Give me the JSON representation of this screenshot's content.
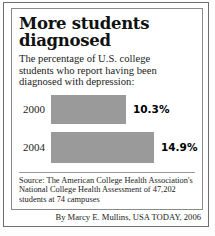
{
  "headline": {
    "line1": "More students",
    "line2": "diagnosed"
  },
  "subhead": {
    "line1": "The percentage of U.S. college",
    "line2": "students who report having been",
    "line3": "diagnosed with depression:"
  },
  "chart_data": {
    "type": "bar",
    "orientation": "horizontal",
    "title": "More students diagnosed",
    "subtitle": "The percentage of U.S. college students who report having been diagnosed with depression:",
    "categories": [
      "2000",
      "2004"
    ],
    "values": [
      10.3,
      14.9
    ],
    "value_labels": [
      "10.3%",
      "14.9%"
    ],
    "xlabel": "",
    "ylabel": "",
    "xlim": [
      0,
      14.9
    ],
    "grid": false,
    "legend": null,
    "bar_color": "#9a9a9a",
    "bar_px_widths": [
      75,
      103
    ]
  },
  "source": {
    "line1": "Source: The American College Health Association's",
    "line2": "National College Health Assessment of 47,202",
    "line3": "students at 74 campuses"
  },
  "byline": "By Marcy E. Mullins, USA TODAY, 2006",
  "colors": {
    "bar": "#9a9a9a",
    "frame": "#6e6e6e",
    "inner_frame": "#8a8a8a",
    "text": "#111111",
    "background": "#ffffff"
  }
}
